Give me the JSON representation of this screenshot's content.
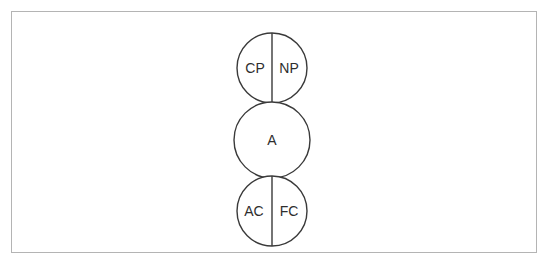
{
  "diagram": {
    "stroke_color": "#3a3a3a",
    "frame_color": "#b4b4b4",
    "background_color": "#ffffff",
    "text_color": "#2e2e2e",
    "circles": [
      {
        "id": "parent",
        "center_x": 272,
        "center_y": 68,
        "radius": 35,
        "divided": true,
        "labels": [
          {
            "text": "CP",
            "x": 255,
            "y": 68
          },
          {
            "text": "NP",
            "x": 289,
            "y": 68
          }
        ]
      },
      {
        "id": "adult",
        "center_x": 272,
        "center_y": 140,
        "radius": 38,
        "divided": false,
        "labels": [
          {
            "text": "A",
            "x": 272,
            "y": 140
          }
        ]
      },
      {
        "id": "child",
        "center_x": 272,
        "center_y": 211,
        "radius": 35,
        "divided": true,
        "labels": [
          {
            "text": "AC",
            "x": 254,
            "y": 211
          },
          {
            "text": "FC",
            "x": 289,
            "y": 211
          }
        ]
      }
    ]
  }
}
